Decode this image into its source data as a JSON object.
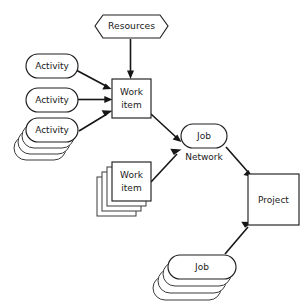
{
  "diagram": {
    "background_color": "#ffffff",
    "line_color": "#161616",
    "text_color": "#1a1a1a",
    "nodes": {
      "resources": {
        "label": "Resources",
        "shape": "hexagon"
      },
      "activity_1": {
        "label": "Activity",
        "shape": "stadium"
      },
      "activity_2": {
        "label": "Activity",
        "shape": "stadium"
      },
      "activity_3": {
        "label": "Activity",
        "shape": "stadium-stack",
        "stack_count": 4
      },
      "work_item_1": {
        "label_line_1": "Work",
        "label_line_2": "item",
        "shape": "rectangle"
      },
      "work_item_2": {
        "label_line_1": "Work",
        "label_line_2": "item",
        "shape": "rectangle-stack",
        "stack_count": 4
      },
      "job_1": {
        "label": "Job",
        "shape": "stadium"
      },
      "job_network_label": {
        "label": "Network"
      },
      "job_2": {
        "label": "Job",
        "shape": "stadium-stack",
        "stack_count": 4
      },
      "project": {
        "label": "Project",
        "shape": "rectangle"
      }
    },
    "edges": [
      {
        "from": "resources",
        "to": "work_item_1"
      },
      {
        "from": "activity_1",
        "to": "work_item_1"
      },
      {
        "from": "activity_2",
        "to": "work_item_1"
      },
      {
        "from": "activity_3",
        "to": "work_item_1"
      },
      {
        "from": "work_item_1",
        "to": "job_1"
      },
      {
        "from": "work_item_2",
        "to": "job_1"
      },
      {
        "from": "job_1",
        "to": "project"
      },
      {
        "from": "job_2",
        "to": "project"
      }
    ]
  }
}
